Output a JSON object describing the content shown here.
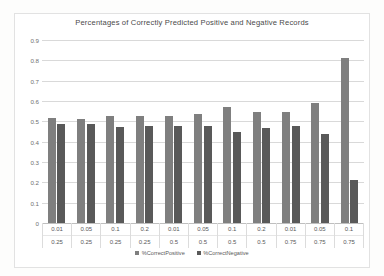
{
  "chart_data": {
    "type": "bar",
    "title": "Percentages of Correctly Predicted Positive and Negative Records",
    "xlabel": "",
    "ylabel": "",
    "ylim": [
      0,
      0.9
    ],
    "yticks": [
      "0",
      "0.1",
      "0.2",
      "0.3",
      "0.4",
      "0.5",
      "0.6",
      "0.7",
      "0.8",
      "0.9"
    ],
    "grid": true,
    "legend_position": "bottom",
    "categories": [
      {
        "row1": "0.01",
        "row2": "0.25"
      },
      {
        "row1": "0.05",
        "row2": "0.25"
      },
      {
        "row1": "0.1",
        "row2": "0.25"
      },
      {
        "row1": "0.2",
        "row2": "0.25"
      },
      {
        "row1": "0.01",
        "row2": "0.5"
      },
      {
        "row1": "0.05",
        "row2": "0.5"
      },
      {
        "row1": "0.1",
        "row2": "0.5"
      },
      {
        "row1": "0.2",
        "row2": "0.5"
      },
      {
        "row1": "0.01",
        "row2": "0.75"
      },
      {
        "row1": "0.05",
        "row2": "0.75"
      },
      {
        "row1": "0.1",
        "row2": "0.75"
      }
    ],
    "series": [
      {
        "name": "%CorrectPositive",
        "color": "#7f7f7f",
        "values": [
          0.515,
          0.513,
          0.528,
          0.525,
          0.527,
          0.536,
          0.569,
          0.546,
          0.545,
          0.591,
          0.812
        ]
      },
      {
        "name": "%CorrectNegative",
        "color": "#595959",
        "values": [
          0.487,
          0.487,
          0.474,
          0.478,
          0.479,
          0.475,
          0.449,
          0.468,
          0.477,
          0.438,
          0.212
        ]
      }
    ]
  }
}
